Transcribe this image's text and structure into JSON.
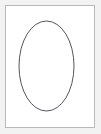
{
  "figure": {
    "width": 101,
    "height": 134,
    "background_color": "#f2f2f2",
    "canvas_color": "#ffffff"
  },
  "frame": {
    "name": "figure-border",
    "x": 5,
    "y": 5,
    "width": 90,
    "height": 123,
    "stroke_color": "#b9b9b9",
    "stroke_width": 1,
    "fill_color": "#ffffff"
  },
  "shapes": [
    {
      "name": "ellipse",
      "type": "ellipse",
      "center_x": 46.5,
      "center_y": 66,
      "radius_x": 27.5,
      "radius_y": 45,
      "bounds": {
        "left": 19,
        "top": 21,
        "right": 74,
        "bottom": 111
      },
      "stroke_color": "#555560",
      "stroke_width": 1,
      "fill": "none"
    }
  ],
  "labels": {
    "figure_caption": "",
    "axis_labels": [],
    "annotations": []
  }
}
